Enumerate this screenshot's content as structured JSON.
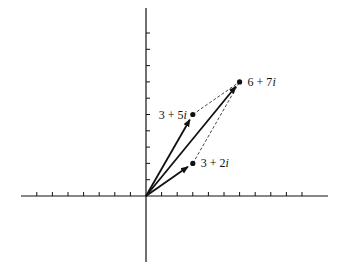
{
  "diagram": {
    "title": "",
    "type": "complex-plane vector addition (parallelogram)",
    "axes": {
      "origin_px": [
        146,
        196
      ],
      "x_unit_px": 15.6,
      "y_unit_px": 16.3,
      "x_ticks_left": 7,
      "x_ticks_right": 10,
      "y_ticks_up": 10,
      "x_axis_px": [
        21,
        328
      ],
      "y_axis_px": [
        8,
        262
      ]
    },
    "points": [
      {
        "id": "z1",
        "label_text": "3 + 5",
        "label_i": "i",
        "re": 3,
        "im": 5,
        "label_side": "left"
      },
      {
        "id": "z2",
        "label_text": "3 + 2",
        "label_i": "i",
        "re": 3,
        "im": 2,
        "label_side": "right"
      },
      {
        "id": "sum",
        "label_text": "6 + 7",
        "label_i": "i",
        "re": 6,
        "im": 7,
        "label_side": "right"
      }
    ],
    "vectors": [
      {
        "from": "origin",
        "to": "z1",
        "style": "solid-arrow"
      },
      {
        "from": "origin",
        "to": "z2",
        "style": "solid-arrow"
      },
      {
        "from": "origin",
        "to": "sum",
        "style": "solid-arrow"
      }
    ],
    "dashed_edges": [
      {
        "from": "z1",
        "to": "sum"
      },
      {
        "from": "z2",
        "to": "sum"
      }
    ],
    "colors": {
      "ink": "#111111",
      "background": "#ffffff"
    }
  }
}
